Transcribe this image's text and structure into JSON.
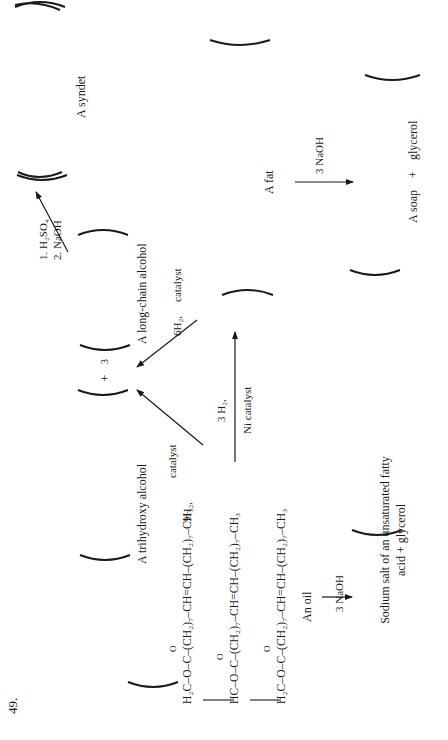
{
  "problem_number": "49.",
  "triglyceride": {
    "rows": [
      {
        "head": "H₂C",
        "chain": "–O–C–(CH₂)₇–CH=CH–(CH₂)₇–CH₃",
        "carbonyl": "O"
      },
      {
        "head": "HC",
        "chain": "–O–C–(CH₂)₇–CH=CH–(CH₂)₇–CH₃",
        "carbonyl": "O"
      },
      {
        "head": "H₂C",
        "chain": "–O–C–(CH₂)₇–CH=CH–(CH₂)₇–CH₃",
        "carbonyl": "O"
      }
    ]
  },
  "reactions": {
    "oil_saponification": {
      "reactant_label": "An oil",
      "reagent": "3 NaOH",
      "product": [
        "Sodium salt of an unsaturated fatty",
        "acid + glycerol"
      ]
    },
    "full_hydrogenation": {
      "reagent_top": "9H₂,",
      "reagent_bottom": "catalyst",
      "product_left": "A trihydroxy alcohol",
      "plus": "+",
      "coefficient": "3",
      "product_right": "A long-chain alcohol"
    },
    "partial_hydrogenation": {
      "reagent_top": "3 H₂,",
      "reagent_bottom": "Ni catalyst"
    },
    "fat_hydrogenolysis": {
      "reagent_top": "6H₂,",
      "reagent_bottom": "catalyst"
    },
    "sulfonation": {
      "step1": "1.  H₂SO₄",
      "step2": "2.  NaOH",
      "product": "A syndet"
    },
    "fat_saponification": {
      "reactant_label": "A fat",
      "reagent": "3 NaOH",
      "product_left": "A soap",
      "plus": "+",
      "product_right": "glycerol"
    }
  }
}
